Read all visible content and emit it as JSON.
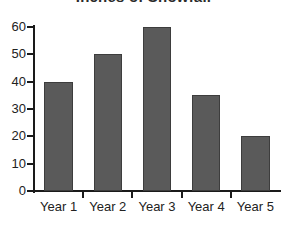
{
  "chart_data": {
    "type": "bar",
    "title": "Inches of Snowfall",
    "subtitle": "",
    "xlabel": "",
    "ylabel": "",
    "categories": [
      "Year 1",
      "Year 2",
      "Year 3",
      "Year 4",
      "Year 5"
    ],
    "values": [
      40,
      50,
      60,
      35,
      20
    ],
    "ylim": [
      0,
      60
    ],
    "ytick_labels": [
      "60",
      "50",
      "40",
      "30",
      "20",
      "10",
      "0"
    ],
    "ytick_values": [
      60,
      50,
      40,
      30,
      20,
      10,
      0
    ],
    "ytick_step": 10,
    "grid": false,
    "legend": false,
    "legend_position": "none",
    "bar_color": "#5a5a5a",
    "bar_edge_color": "#3d3d3d",
    "axis_color": "#1a1a1a",
    "text_color": "#222222",
    "background_color": "#ffffff",
    "title_clipped": true
  }
}
